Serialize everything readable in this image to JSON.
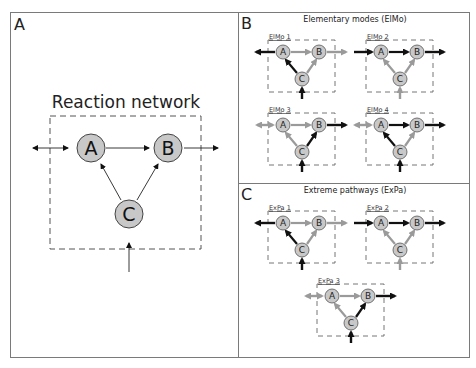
{
  "panels": {
    "a": {
      "letter": "A",
      "title": "Reaction network"
    },
    "b": {
      "letter": "B",
      "title": "Elementary modes (ElMo)",
      "modes": [
        {
          "label": "ElMo 1"
        },
        {
          "label": "ElMo 2"
        },
        {
          "label": "ElMo 3"
        },
        {
          "label": "ElMo 4"
        }
      ]
    },
    "c": {
      "letter": "C",
      "title": "Extreme pathways (ExPa)",
      "pathways": [
        {
          "label": "ExPa 1"
        },
        {
          "label": "ExPa 2"
        },
        {
          "label": "ExPa 3"
        }
      ]
    }
  },
  "nodes": {
    "a": "A",
    "b": "B",
    "c": "C"
  },
  "colors": {
    "node_fill": "#c8c8c8",
    "active_flux": "#111111",
    "inactive_flux": "#9a9a9a",
    "frame": "#7a7a7a",
    "dashed": "#555555"
  }
}
